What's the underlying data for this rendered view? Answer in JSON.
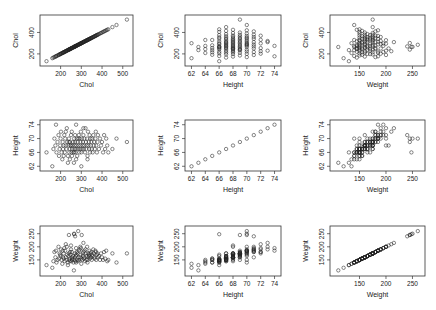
{
  "chart_data": {
    "type": "scatter",
    "title": "",
    "layout": "3x3 scatterplot matrix (pairs)",
    "variables": [
      "Chol",
      "Height",
      "Weight"
    ],
    "ranges": {
      "Chol": [
        115,
        535
      ],
      "Height": [
        61.5,
        74.5
      ],
      "Weight": [
        100,
        268
      ]
    },
    "ticks": {
      "Chol": [
        200,
        300,
        400,
        500
      ],
      "Height": [
        62,
        64,
        66,
        68,
        70,
        72,
        74
      ],
      "Weight": [
        150,
        200,
        250
      ]
    },
    "y_ticks": {
      "Chol": [
        200,
        400
      ],
      "Height": [
        62,
        66,
        70,
        74
      ],
      "Weight": [
        150,
        200,
        250
      ]
    },
    "panels": [
      {
        "row": 0,
        "col": 0,
        "x": "Chol",
        "y": "Chol"
      },
      {
        "row": 0,
        "col": 1,
        "x": "Height",
        "y": "Chol"
      },
      {
        "row": 0,
        "col": 2,
        "x": "Weight",
        "y": "Chol"
      },
      {
        "row": 1,
        "col": 0,
        "x": "Chol",
        "y": "Height"
      },
      {
        "row": 1,
        "col": 1,
        "x": "Height",
        "y": "Height"
      },
      {
        "row": 1,
        "col": 2,
        "x": "Weight",
        "y": "Height"
      },
      {
        "row": 2,
        "col": 0,
        "x": "Chol",
        "y": "Weight"
      },
      {
        "row": 2,
        "col": 1,
        "x": "Height",
        "y": "Weight"
      },
      {
        "row": 2,
        "col": 2,
        "x": "Weight",
        "y": "Weight"
      }
    ],
    "grid": false,
    "legend": null,
    "records_note": "approximate sample of observations read from the plot",
    "records": [
      [
        132,
        66,
        130
      ],
      [
        160,
        62,
        120
      ],
      [
        165,
        67,
        145
      ],
      [
        170,
        70,
        180
      ],
      [
        175,
        68,
        160
      ],
      [
        178,
        74,
        185
      ],
      [
        180,
        66,
        140
      ],
      [
        185,
        69,
        150
      ],
      [
        190,
        71,
        200
      ],
      [
        192,
        65,
        155
      ],
      [
        195,
        67,
        175
      ],
      [
        198,
        68,
        170
      ],
      [
        200,
        70,
        165
      ],
      [
        202,
        72,
        190
      ],
      [
        205,
        66,
        150
      ],
      [
        208,
        64,
        135
      ],
      [
        210,
        69,
        185
      ],
      [
        212,
        67,
        160
      ],
      [
        215,
        68,
        175
      ],
      [
        218,
        71,
        195
      ],
      [
        220,
        66,
        145
      ],
      [
        222,
        70,
        185
      ],
      [
        225,
        68,
        160
      ],
      [
        228,
        67,
        150
      ],
      [
        230,
        73,
        200
      ],
      [
        232,
        69,
        170
      ],
      [
        235,
        65,
        140
      ],
      [
        238,
        68,
        165
      ],
      [
        240,
        70,
        175
      ],
      [
        242,
        66,
        150
      ],
      [
        244,
        67,
        155
      ],
      [
        246,
        69,
        180
      ],
      [
        248,
        68,
        170
      ],
      [
        250,
        71,
        190
      ],
      [
        252,
        66,
        145
      ],
      [
        254,
        72,
        180
      ],
      [
        255,
        67,
        160
      ],
      [
        258,
        68,
        155
      ],
      [
        260,
        69,
        165
      ],
      [
        262,
        66,
        140
      ],
      [
        264,
        63,
        110
      ],
      [
        265,
        70,
        250
      ],
      [
        266,
        67,
        150
      ],
      [
        268,
        68,
        160
      ],
      [
        270,
        69,
        175
      ],
      [
        272,
        66,
        145
      ],
      [
        274,
        67,
        165
      ],
      [
        275,
        74,
        195
      ],
      [
        276,
        68,
        170
      ],
      [
        278,
        70,
        180
      ],
      [
        280,
        65,
        150
      ],
      [
        282,
        69,
        175
      ],
      [
        284,
        67,
        145
      ],
      [
        286,
        68,
        160
      ],
      [
        288,
        71,
        185
      ],
      [
        290,
        66,
        150
      ],
      [
        292,
        70,
        190
      ],
      [
        294,
        67,
        160
      ],
      [
        295,
        68,
        200
      ],
      [
        296,
        69,
        170
      ],
      [
        298,
        72,
        195
      ],
      [
        300,
        66,
        155
      ],
      [
        302,
        70,
        245
      ],
      [
        304,
        67,
        150
      ],
      [
        306,
        68,
        175
      ],
      [
        308,
        69,
        165
      ],
      [
        310,
        71,
        180
      ],
      [
        312,
        67,
        155
      ],
      [
        314,
        68,
        160
      ],
      [
        315,
        70,
        185
      ],
      [
        318,
        66,
        145
      ],
      [
        320,
        73,
        190
      ],
      [
        322,
        69,
        175
      ],
      [
        324,
        67,
        150
      ],
      [
        326,
        68,
        165
      ],
      [
        328,
        70,
        200
      ],
      [
        330,
        65,
        140
      ],
      [
        332,
        72,
        175
      ],
      [
        334,
        68,
        160
      ],
      [
        336,
        69,
        170
      ],
      [
        338,
        67,
        165
      ],
      [
        340,
        71,
        185
      ],
      [
        342,
        66,
        155
      ],
      [
        344,
        70,
        175
      ],
      [
        346,
        68,
        160
      ],
      [
        348,
        69,
        180
      ],
      [
        350,
        67,
        150
      ],
      [
        352,
        70,
        170
      ],
      [
        355,
        66,
        165
      ],
      [
        358,
        71,
        190
      ],
      [
        360,
        68,
        175
      ],
      [
        362,
        69,
        160
      ],
      [
        365,
        67,
        155
      ],
      [
        368,
        70,
        185
      ],
      [
        370,
        72,
        180
      ],
      [
        372,
        68,
        150
      ],
      [
        375,
        66,
        170
      ],
      [
        378,
        69,
        175
      ],
      [
        380,
        71,
        160
      ],
      [
        385,
        67,
        165
      ],
      [
        390,
        70,
        150
      ],
      [
        395,
        68,
        175
      ],
      [
        400,
        69,
        160
      ],
      [
        405,
        66,
        150
      ],
      [
        410,
        71,
        180
      ],
      [
        415,
        67,
        155
      ],
      [
        420,
        70,
        185
      ],
      [
        425,
        68,
        145
      ],
      [
        430,
        66,
        150
      ],
      [
        450,
        67,
        175
      ],
      [
        470,
        70,
        140
      ],
      [
        520,
        69,
        175
      ],
      [
        245,
        64,
        145
      ],
      [
        255,
        65,
        150
      ],
      [
        235,
        63,
        130
      ],
      [
        300,
        62,
        135
      ],
      [
        275,
        64,
        140
      ],
      [
        215,
        65,
        155
      ],
      [
        330,
        64,
        150
      ],
      [
        285,
        70,
        260
      ],
      [
        240,
        69,
        245
      ],
      [
        270,
        71,
        240
      ],
      [
        250,
        68,
        205
      ],
      [
        310,
        73,
        215
      ],
      [
        265,
        66,
        248
      ],
      [
        225,
        72,
        210
      ]
    ]
  }
}
